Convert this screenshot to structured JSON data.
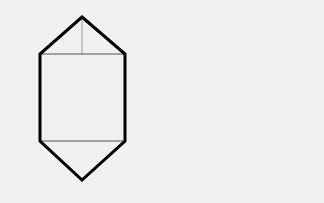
{
  "diagram": {
    "background": "#f1f1f1",
    "outline_color": "#000000",
    "inner_line_color": "#888888",
    "vertices": {
      "top_apex": [
        82,
        17
      ],
      "top_left": [
        40,
        54
      ],
      "top_right": [
        125,
        54
      ],
      "bottom_left": [
        40,
        141
      ],
      "bottom_right": [
        125,
        141
      ],
      "bottom_apex": [
        82,
        180
      ]
    }
  }
}
